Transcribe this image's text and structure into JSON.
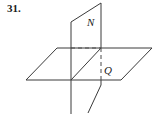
{
  "figure": {
    "problem_number": "31.",
    "background_color": "#ffffff",
    "line_color": "#3a3a3a",
    "hidden_line_color": "#4a4a4a",
    "label_color": "#1a1a1a",
    "labels": {
      "plane_n": "N",
      "plane_q": "Q"
    },
    "label_positions": {
      "plane_n": {
        "x": 87,
        "y": 26
      },
      "plane_q": {
        "x": 104,
        "y": 74
      }
    },
    "planes": [
      {
        "name": "Q",
        "orientation": "horizontal",
        "shape": "parallelogram",
        "vertices": [
          {
            "x": 26,
            "y": 80
          },
          {
            "x": 57,
            "y": 48
          },
          {
            "x": 152,
            "y": 48
          },
          {
            "x": 121,
            "y": 80
          }
        ]
      },
      {
        "name": "N",
        "orientation": "vertical",
        "shape": "parallelogram",
        "vertices": [
          {
            "x": 71,
            "y": 22
          },
          {
            "x": 101,
            "y": 3
          },
          {
            "x": 101,
            "y": 85
          },
          {
            "x": 71,
            "y": 104
          }
        ]
      }
    ],
    "hidden_edges": [
      {
        "from": {
          "x": 71,
          "y": 48
        },
        "to": {
          "x": 101,
          "y": 48
        }
      },
      {
        "from": {
          "x": 101,
          "y": 48
        },
        "to": {
          "x": 101,
          "y": 80
        }
      }
    ],
    "intersection_line": {
      "from": {
        "x": 71,
        "y": 48
      },
      "to": {
        "x": 101,
        "y": 48
      }
    }
  }
}
